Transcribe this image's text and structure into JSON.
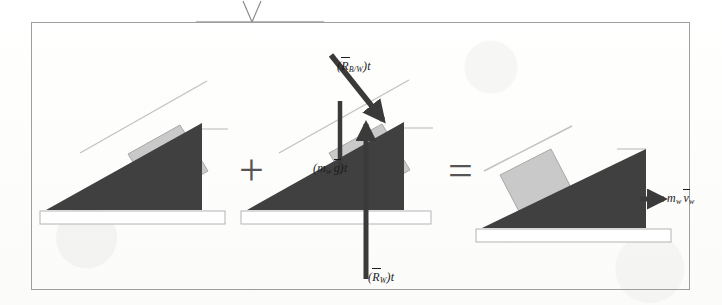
{
  "figure": {
    "kind": "physics-free-body-impulse-momentum-diagram",
    "frame": {
      "border_color": "#9e9e9e",
      "background": "#ffffff"
    },
    "colors": {
      "wedge_fill": "#404040",
      "block_fill": "#c9c9c9",
      "block_edge": "#9a9a9a",
      "ground_fill": "#ffffff",
      "ground_edge": "#b4b4b4",
      "arrow": "#3a3a3a",
      "operator": "#555555",
      "label_text": "#1c1c1c",
      "incline_guide": "#bdbdbd"
    },
    "operators": {
      "plus": "+",
      "equals": "="
    },
    "top_annotation": {
      "name": "caret-marker",
      "glyph": "V",
      "rule_color": "#b9b9b9"
    },
    "panels": [
      {
        "id": "panel-left",
        "name": "initial-state-panel",
        "caption": "",
        "block_position": "upper-incline",
        "arrows": []
      },
      {
        "id": "panel-middle",
        "name": "impulse-forces-panel",
        "caption": "",
        "block_position": "upper-incline",
        "arrows": [
          {
            "name": "reaction-block-on-wedge-arrow",
            "label_main": "R",
            "label_sub": "B/W",
            "label_suffix": ")t",
            "label_prefix": "(",
            "label_full": "(R̄B/W)t",
            "direction": "down-right",
            "vector": true
          },
          {
            "name": "wedge-weight-impulse-arrow",
            "label_main": "g",
            "label_sub": "w",
            "label_prefix": "(m",
            "label_suffix": ")t",
            "label_full": "(mw ḡ)t",
            "direction": "down",
            "vector": true
          },
          {
            "name": "ground-reaction-impulse-arrow",
            "label_main": "R",
            "label_sub": "W",
            "label_prefix": "(",
            "label_suffix": ")t",
            "label_full": "(R̄W)t",
            "direction": "up",
            "vector": true
          }
        ]
      },
      {
        "id": "panel-right",
        "name": "final-momentum-panel",
        "caption": "",
        "block_position": "lower-incline",
        "arrows": [
          {
            "name": "wedge-momentum-arrow",
            "label_main": "v",
            "label_sub": "w",
            "label_prefix": "m",
            "label_prefix_sub": "w",
            "label_suffix": "",
            "label_full": "mw v̄w",
            "direction": "right",
            "vector": true
          }
        ]
      }
    ],
    "labels": {
      "reaction_block_on_wedge": {
        "open": "(",
        "sym": "R",
        "sub": "B/W",
        "close": ")t"
      },
      "wedge_weight": {
        "open": "(",
        "m": "m",
        "m_sub": "w",
        "g": "g",
        "close": ")t"
      },
      "ground_reaction": {
        "open": "(",
        "sym": "R",
        "sub": "W",
        "close": ")t"
      },
      "wedge_momentum": {
        "m": "m",
        "m_sub": "w",
        "v": "v",
        "v_sub": "w"
      }
    }
  }
}
